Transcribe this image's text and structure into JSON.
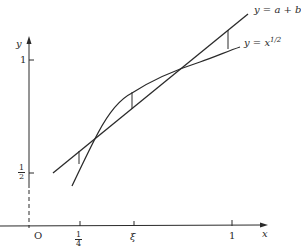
{
  "diagram": {
    "axes": {
      "x_label": "x",
      "y_label": "y",
      "origin_label": "O",
      "y_ticks": [
        {
          "label": "1",
          "value": 1
        },
        {
          "label_num": "1",
          "label_den": "2",
          "value": 0.5
        }
      ],
      "x_ticks": [
        {
          "label_num": "1",
          "label_den": "4",
          "value": 0.25
        },
        {
          "label": "ξ",
          "value": "xi"
        },
        {
          "label": "1",
          "value": 1
        }
      ]
    },
    "curves": [
      {
        "name": "line",
        "label": "y = a + bx"
      },
      {
        "name": "sqrt",
        "label_base": "y = x",
        "label_exp": "1/2"
      }
    ],
    "colors": {
      "ink": "#2a2a2a",
      "background": "#ffffff"
    }
  }
}
